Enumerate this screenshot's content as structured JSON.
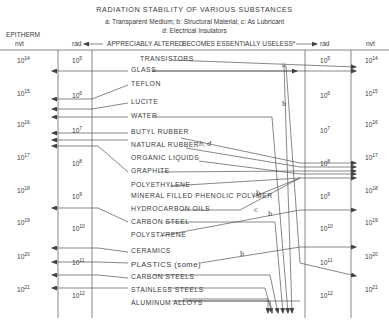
{
  "title": "RADIATION STABILITY OF VARIOUS SUBSTANCES",
  "legend_line1": "a: Transparent Medium;  b: Structural Material;  c: As Lubricant",
  "legend_line2": "d: Electrical Insulators",
  "headers": {
    "left_top": "EPITHERM",
    "left_nvt": "nvt",
    "left_rad": "rad",
    "middle_left": "APPRECIABLY ALTERED",
    "middle_right": "BECOMES ESSENTIALLY USELESS*",
    "right_rad": "rad",
    "right_nvt": "nvt"
  },
  "scale": {
    "nvt": [
      "10",
      "10",
      "10",
      "10",
      "10",
      "10",
      "10",
      "10"
    ],
    "nvt_exp": [
      "14",
      "15",
      "16",
      "17",
      "18",
      "19",
      "20",
      "21"
    ],
    "rad": [
      "10",
      "10",
      "10",
      "10",
      "10",
      "10",
      "10",
      "10"
    ],
    "rad_exp": [
      "5",
      "6",
      "7",
      "8",
      "9",
      "10",
      "11",
      "12"
    ]
  },
  "materials": [
    "TRANSISTORS",
    "GLASS",
    "TEFLON",
    "LUCITE",
    "WATER",
    "BUTYL RUBBER",
    "NATURAL RUBBER",
    "ORGANIC LIQUIDS",
    "GRAPHITE",
    "POLYETHYLENE",
    "MINERAL FILLED PHENOLIC POLYMER",
    "HYDROCARBON OILS",
    "CARBON STEEL",
    "POLYSTYRENE",
    "CERAMICS",
    "PLASTICS (some)",
    "CARBON STEELS",
    "STAINLESS STEELS",
    "ALUMINUM ALLOYS"
  ],
  "line_labels": {
    "glass_a": "a",
    "glass_b": "b",
    "natural_rubber": "b, d",
    "polyethylene": "b",
    "hydrocarbon": "c",
    "polystyrene": "b",
    "plastics": "b"
  }
}
